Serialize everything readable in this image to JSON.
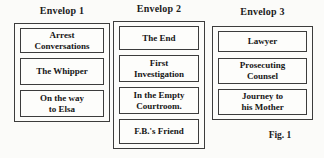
{
  "figure": {
    "caption": "Fig. 1",
    "colors": {
      "background": "#fbfbf9",
      "border": "#3c3c3c",
      "text": "#1a1a1a"
    },
    "columns": [
      {
        "title": "Envelop 1",
        "items": [
          "Arrest\nConversations",
          "The Whipper",
          "On the way\nto Elsa"
        ]
      },
      {
        "title": "Envelop 2",
        "items": [
          "The End",
          "First\nInvestigation",
          "In the Empty\nCourtroom.",
          "F.B.'s Friend"
        ]
      },
      {
        "title": "Envelop 3",
        "items": [
          "Lawyer",
          "Prosecuting\nCounsel",
          "Journey to\nhis Mother"
        ]
      }
    ]
  }
}
